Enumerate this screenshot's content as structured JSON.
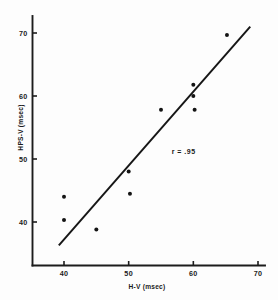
{
  "chart_data": {
    "type": "scatter",
    "title": "",
    "xlabel": "H-V (msec)",
    "ylabel": "HPS-V (msec)",
    "xlim": [
      35.5,
      70
    ],
    "ylim": [
      35.5,
      71.5
    ],
    "xticks": [
      40,
      50,
      60,
      70
    ],
    "yticks": [
      40,
      50,
      60,
      70
    ],
    "xticklabels": [
      "40",
      "50",
      "60",
      "70"
    ],
    "yticklabels": [
      "40",
      "50",
      "60",
      "70"
    ],
    "grid": false,
    "legend": null,
    "annotations": [
      {
        "name": "correlation-coefficient",
        "text": "r = .95",
        "x": 58.5,
        "y": 50.8
      }
    ],
    "points": [
      {
        "x": 40.0,
        "y": 44.0
      },
      {
        "x": 40.0,
        "y": 40.3
      },
      {
        "x": 45.0,
        "y": 38.8
      },
      {
        "x": 50.0,
        "y": 48.0
      },
      {
        "x": 50.2,
        "y": 44.5
      },
      {
        "x": 55.0,
        "y": 57.8
      },
      {
        "x": 60.0,
        "y": 61.8
      },
      {
        "x": 60.0,
        "y": 60.0
      },
      {
        "x": 60.2,
        "y": 57.8
      },
      {
        "x": 65.2,
        "y": 69.7
      }
    ],
    "fit_line": {
      "name": "regression-line",
      "x0": 39.2,
      "y0": 36.3,
      "x1": 68.8,
      "y1": 71.0
    },
    "marker_size": 2.0,
    "colors": {
      "marker": "#141414",
      "line": "#161616",
      "axis": "#1c1c1c",
      "background": "#fdfdfd"
    }
  }
}
